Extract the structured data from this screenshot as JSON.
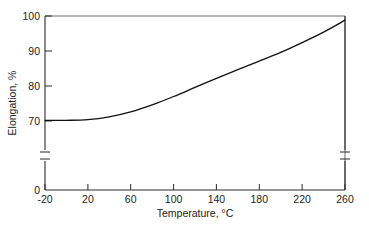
{
  "chart_data": {
    "type": "line",
    "title": "",
    "xlabel": "Temperature, °C",
    "ylabel": "Elongation, %",
    "xlim": [
      -20,
      260
    ],
    "ylim": [
      70,
      100
    ],
    "y_axis_break": true,
    "y_break_base_label": "0",
    "grid": false,
    "legend": null,
    "xticks": [
      -20,
      20,
      60,
      100,
      140,
      180,
      220,
      260
    ],
    "xtick_labels": [
      "-20",
      "20",
      "60",
      "100",
      "140",
      "180",
      "220",
      "260"
    ],
    "yticks": [
      70,
      80,
      90,
      100
    ],
    "ytick_labels": [
      "70",
      "80",
      "90",
      "100"
    ],
    "series": [
      {
        "name": "Elongation vs Temperature",
        "x": [
          -20,
          0,
          20,
          40,
          60,
          80,
          100,
          120,
          140,
          160,
          180,
          200,
          220,
          240,
          260
        ],
        "values": [
          70.2,
          70.2,
          70.4,
          71.2,
          72.6,
          74.6,
          77.0,
          79.6,
          82.2,
          84.7,
          87.1,
          89.6,
          92.4,
          95.4,
          98.8
        ]
      }
    ]
  }
}
